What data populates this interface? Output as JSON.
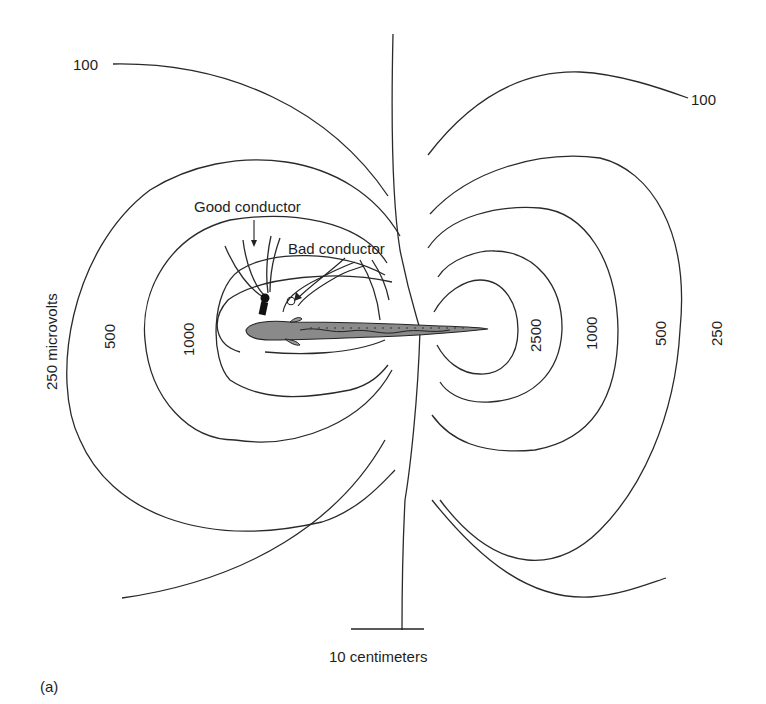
{
  "figure": {
    "panel_label": "(a)",
    "scale_bar": {
      "label": "10 centimeters"
    },
    "annotations": {
      "good_conductor": "Good conductor",
      "bad_conductor": "Bad conductor"
    },
    "contour_labels": {
      "left": {
        "top_100": "100",
        "outer_250": "250 microvolts",
        "mid_500": "500",
        "inner_1000": "1000"
      },
      "right": {
        "top_100": "100",
        "inner_2500": "2500",
        "mid_1000": "1000",
        "outer_500": "500",
        "far_250": "250"
      }
    },
    "colors": {
      "line": "#2a2a2a",
      "fish_fill": "#8a8a8a",
      "background": "#ffffff"
    }
  }
}
